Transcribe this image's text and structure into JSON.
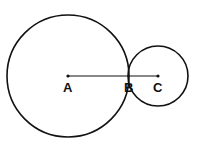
{
  "diagram": {
    "type": "tangent-circles",
    "circles": [
      {
        "name": "large",
        "cx": 68,
        "cy": 76,
        "r": 61
      },
      {
        "name": "small",
        "cx": 158,
        "cy": 76,
        "r": 30
      }
    ],
    "segment": {
      "from": "A",
      "to": "C"
    },
    "points": [
      {
        "label": "A",
        "x": 68,
        "y": 76
      },
      {
        "label": "B",
        "x": 128,
        "y": 76
      },
      {
        "label": "C",
        "x": 158,
        "y": 76
      }
    ],
    "stroke_color": "#111111"
  }
}
